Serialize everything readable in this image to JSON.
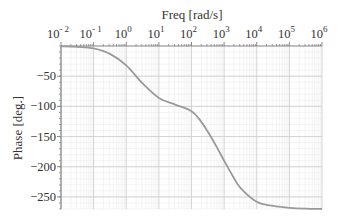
{
  "chart_data": {
    "type": "line",
    "title": "",
    "xlabel": "Freq [rad/s]",
    "ylabel": "Phase [deg.]",
    "xscale": "log",
    "xlim": [
      0.01,
      1000000
    ],
    "ylim": [
      -270,
      0
    ],
    "x_ticks": [
      {
        "base": "10",
        "exp": "-2"
      },
      {
        "base": "10",
        "exp": "-1"
      },
      {
        "base": "10",
        "exp": "0"
      },
      {
        "base": "10",
        "exp": "1"
      },
      {
        "base": "10",
        "exp": "2"
      },
      {
        "base": "10",
        "exp": "3"
      },
      {
        "base": "10",
        "exp": "4"
      },
      {
        "base": "10",
        "exp": "5"
      },
      {
        "base": "10",
        "exp": "6"
      }
    ],
    "y_ticks": [
      -50,
      -100,
      -150,
      -200,
      -250
    ],
    "y_tick_labels": [
      "−50",
      "−100",
      "−150",
      "−200",
      "−250"
    ],
    "grid": true,
    "x_axis_position": "top",
    "legend": null,
    "series": [
      {
        "name": "Phase",
        "color": "#9a9a9a",
        "x_log10": [
          -2,
          -1.5,
          -1,
          -0.5,
          0,
          0.5,
          1,
          1.5,
          2,
          2.25,
          2.5,
          2.75,
          3,
          3.25,
          3.5,
          4,
          4.5,
          5,
          5.5,
          6
        ],
        "values": [
          -0.6,
          -1.5,
          -4,
          -13,
          -32,
          -62,
          -86,
          -97,
          -108,
          -122,
          -142,
          -165,
          -190,
          -214,
          -235,
          -258,
          -265,
          -268,
          -269.5,
          -270
        ]
      }
    ],
    "colors": {
      "grid_major": "#cfcfcf",
      "grid_minor": "#ececec",
      "frame": "#888888",
      "text": "#333333"
    }
  }
}
